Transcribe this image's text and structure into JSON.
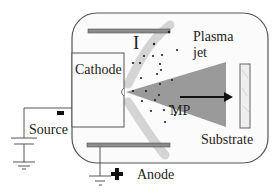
{
  "diagram": {
    "type": "plasma-jet-schematic",
    "labels": {
      "cathode": "Cathode",
      "plasma_jet_line1": "Plasma",
      "plasma_jet_line2": "jet",
      "ion_marker": "I",
      "macroparticle": "MP",
      "substrate": "Substrate",
      "source": "Source",
      "anode": "Anode",
      "source_polarity": "−",
      "anode_polarity": "+"
    },
    "colors": {
      "chamber_stroke": "#555555",
      "chamber_fill": "#fbfbfb",
      "plate_fill": "#8a8a8a",
      "plasma_cone": "#9a9a9a",
      "ion_flow": "#d4d4d4",
      "particles": "#222222",
      "arrow": "#111111",
      "substrate_fill": "#eeeeee"
    }
  }
}
